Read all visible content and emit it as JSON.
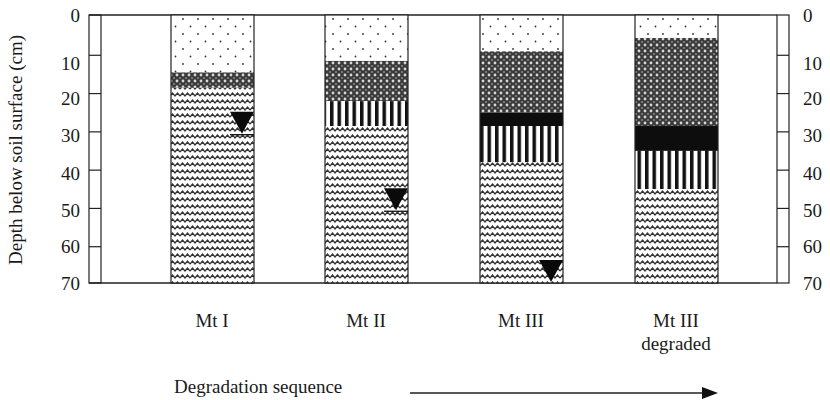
{
  "figure": {
    "y_axis_label": "Depth below soil surface (cm)",
    "y_ticks": [
      "0",
      "10",
      "20",
      "30",
      "40",
      "50",
      "60",
      "70"
    ],
    "x_axis_label": "Degradation sequence",
    "columns": [
      {
        "label": "Mt I",
        "label2": ""
      },
      {
        "label": "Mt II",
        "label2": ""
      },
      {
        "label": "Mt III",
        "label2": ""
      },
      {
        "label": "Mt III",
        "label2": "degraded"
      }
    ]
  },
  "chart_data": {
    "type": "stratigraphic-column",
    "ylabel": "Depth below soil surface (cm)",
    "xlabel": "Degradation sequence",
    "ylim": [
      0,
      70
    ],
    "y_ticks": [
      0,
      10,
      20,
      30,
      40,
      50,
      60,
      70
    ],
    "patterns": {
      "dots": "dotted (sparse stipple)",
      "crosshatch": "dense cross-hatch",
      "black": "solid black",
      "stripes": "vertical stripes",
      "wavy": "wavy lines"
    },
    "profiles": [
      {
        "name": "Mt I",
        "layers": [
          {
            "pattern": "dots",
            "top": 0,
            "bottom": 15
          },
          {
            "pattern": "crosshatch",
            "top": 15,
            "bottom": 19
          },
          {
            "pattern": "wavy",
            "top": 19,
            "bottom": 70
          }
        ],
        "water_table_cm": 31
      },
      {
        "name": "Mt II",
        "layers": [
          {
            "pattern": "dots",
            "top": 0,
            "bottom": 12
          },
          {
            "pattern": "crosshatch",
            "top": 12,
            "bottom": 22.5
          },
          {
            "pattern": "stripes",
            "top": 22.5,
            "bottom": 29
          },
          {
            "pattern": "wavy",
            "top": 29,
            "bottom": 70
          }
        ],
        "water_table_cm": 51
      },
      {
        "name": "Mt III",
        "layers": [
          {
            "pattern": "dots",
            "top": 0,
            "bottom": 9.5
          },
          {
            "pattern": "crosshatch",
            "top": 9.5,
            "bottom": 25.5
          },
          {
            "pattern": "black",
            "top": 25.5,
            "bottom": 29
          },
          {
            "pattern": "stripes",
            "top": 29,
            "bottom": 38.5
          },
          {
            "pattern": "wavy",
            "top": 38.5,
            "bottom": 70
          }
        ],
        "water_table_cm": 70
      },
      {
        "name": "Mt III degraded",
        "layers": [
          {
            "pattern": "dots",
            "top": 0,
            "bottom": 6
          },
          {
            "pattern": "crosshatch",
            "top": 6,
            "bottom": 29
          },
          {
            "pattern": "black",
            "top": 29,
            "bottom": 35.5
          },
          {
            "pattern": "stripes",
            "top": 35.5,
            "bottom": 45.5
          },
          {
            "pattern": "wavy",
            "top": 45.5,
            "bottom": 70
          }
        ],
        "water_table_cm": null
      }
    ]
  }
}
